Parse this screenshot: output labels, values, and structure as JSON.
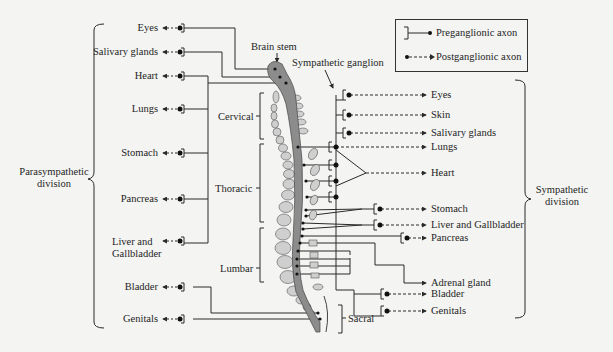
{
  "title_labels": {
    "brain_stem": "Brain stem",
    "sympathetic_ganglion": "Sympathetic ganglion"
  },
  "divisions": {
    "parasympathetic": [
      "Parasympathetic",
      "division"
    ],
    "sympathetic": [
      "Sympathetic",
      "division"
    ]
  },
  "spine_regions": {
    "cervical": "Cervical",
    "thoracic": "Thoracic",
    "lumbar": "Lumbar",
    "sacral": "Sacral"
  },
  "legend": {
    "preganglionic": "Preganglionic axon",
    "postganglionic": "Postganglionic axon",
    "icons": [
      "bracket-line-dot-icon",
      "dot-dashed-arrow-icon"
    ]
  },
  "parasympathetic_targets": [
    {
      "label": "Eyes"
    },
    {
      "label": "Salivary glands"
    },
    {
      "label": "Heart"
    },
    {
      "label": "Lungs"
    },
    {
      "label": "Stomach"
    },
    {
      "label": "Pancreas"
    },
    {
      "label": "Liver and",
      "label2": "Gallbladder"
    },
    {
      "label": "Bladder"
    },
    {
      "label": "Genitals"
    }
  ],
  "sympathetic_targets": [
    {
      "label": "Eyes"
    },
    {
      "label": "Skin"
    },
    {
      "label": "Salivary glands"
    },
    {
      "label": "Lungs"
    },
    {
      "label": "Heart"
    },
    {
      "label": "Stomach"
    },
    {
      "label": "Liver and Gallbladder"
    },
    {
      "label": "Pancreas"
    },
    {
      "label": "Adrenal gland"
    },
    {
      "label": "Bladder"
    },
    {
      "label": "Genitals"
    }
  ],
  "colors": {
    "line": "#2a2a2a",
    "cord": "#8c8c8c",
    "vertebra": "#cfcfcf",
    "background": "#f4f4f2"
  }
}
